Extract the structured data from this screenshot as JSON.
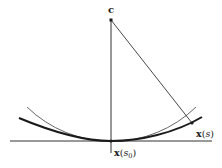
{
  "figure": {
    "colors": {
      "ink": "#1a1a1a",
      "thin": "#555555",
      "background": "#ffffff"
    },
    "labels": {
      "center": "c",
      "point_s0_main": "x",
      "point_s0_arg": "s",
      "point_s0_sub": "0",
      "point_s_main": "x",
      "point_s_arg": "s"
    },
    "elements": {
      "tangent_line": "horizontal tangent line at x(s0)",
      "normal_line": "vertical normal line through c and x(s0)",
      "curve": "curve x(s) (thick)",
      "osculating_circle": "arc of osculating circle centered at c (thin)",
      "radius_segment": "segment from c to x(s)"
    }
  }
}
